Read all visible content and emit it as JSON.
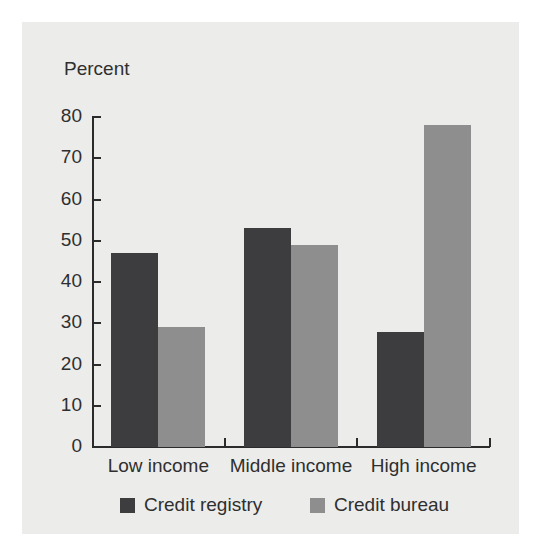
{
  "chart_data": {
    "type": "bar",
    "title": "",
    "subtitle": "",
    "axis_title": "Percent",
    "xlabel": "",
    "ylabel": "Percent",
    "categories": [
      "Low income",
      "Middle income",
      "High income"
    ],
    "series": [
      {
        "name": "Credit registry",
        "color": "#3d3d40",
        "values": [
          47,
          53,
          28
        ]
      },
      {
        "name": "Credit bureau",
        "color": "#8e8e8e",
        "values": [
          29,
          49,
          78
        ]
      }
    ],
    "ylim": [
      0,
      80
    ],
    "ytick_labels": [
      "80",
      "70",
      "60",
      "50",
      "40",
      "30",
      "20",
      "10",
      "0"
    ],
    "ytick_values": [
      80,
      70,
      60,
      50,
      40,
      30,
      20,
      10,
      0
    ],
    "grid": false,
    "legend_position": "bottom"
  },
  "legend": {
    "items": [
      {
        "label": "Credit registry",
        "color": "#3d3d40"
      },
      {
        "label": "Credit bureau",
        "color": "#8e8e8e"
      }
    ]
  },
  "colors": {
    "background": "#ffffff",
    "panel": "#ececeb",
    "axis": "#2b2b2b",
    "text": "#2f2f2f",
    "series_dark": "#3d3d40",
    "series_light": "#8e8e8e"
  }
}
